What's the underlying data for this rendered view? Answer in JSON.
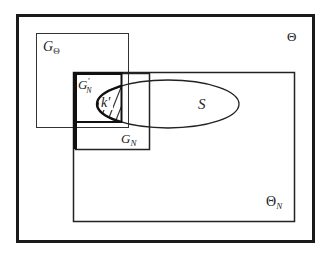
{
  "diagram": {
    "type": "set-inclusion-diagram",
    "colors": {
      "stroke": "#1a1a1a",
      "background": "#ffffff"
    },
    "regions": {
      "outer": {
        "label": "Θ"
      },
      "g_theta": {
        "label_main": "G",
        "label_sub": "Θ"
      },
      "theta_n": {
        "label_main": "Θ",
        "label_sub": "N"
      },
      "g_n": {
        "label_main": "G",
        "label_sub": "N"
      },
      "g_n_prime": {
        "label_main": "G",
        "label_prime": "′",
        "label_sub": "N"
      },
      "s": {
        "label": "S"
      },
      "k_prime": {
        "label": "k′"
      }
    }
  }
}
